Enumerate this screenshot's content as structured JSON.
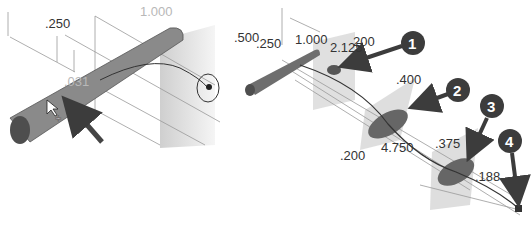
{
  "left_view": {
    "dimensions": [
      {
        "label": ".250",
        "x": 45,
        "y": 28
      },
      {
        "label": "1.000",
        "x": 140,
        "y": 16
      },
      {
        "label": ".031",
        "x": 64,
        "y": 86
      }
    ]
  },
  "right_view": {
    "dimensions": [
      {
        "label": ".500",
        "x": 234,
        "y": 42
      },
      {
        "label": ".250",
        "x": 256,
        "y": 48
      },
      {
        "label": "1.000",
        "x": 295,
        "y": 44
      },
      {
        "label": "2.125",
        "x": 330,
        "y": 52
      },
      {
        "label": "200",
        "x": 353,
        "y": 46
      },
      {
        "label": ".400",
        "x": 396,
        "y": 84
      },
      {
        "label": ".200",
        "x": 340,
        "y": 160
      },
      {
        "label": "4.750",
        "x": 381,
        "y": 152
      },
      {
        "label": ".375",
        "x": 435,
        "y": 148
      },
      {
        "label": ".188",
        "x": 475,
        "y": 181
      }
    ],
    "callouts": [
      {
        "number": "1",
        "x": 413,
        "y": 43
      },
      {
        "number": "2",
        "x": 458,
        "y": 90
      },
      {
        "number": "3",
        "x": 492,
        "y": 106
      },
      {
        "number": "4",
        "x": 510,
        "y": 141
      }
    ]
  },
  "colors": {
    "solid": "#6e6e6e",
    "solid_dark": "#4a4a4a",
    "plane": "#c8c8c8",
    "callout_bg": "#3c3c3c",
    "line": "#555555"
  }
}
